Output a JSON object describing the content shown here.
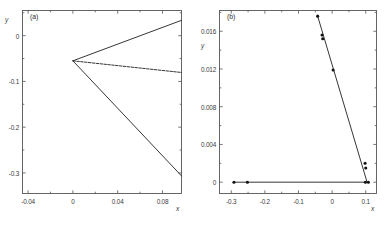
{
  "figure": {
    "background": "#ffffff",
    "line_color": "#2b2b2b",
    "marker_color": "#111111",
    "axis_color": "#555555"
  },
  "panels": [
    {
      "tag": "(a)",
      "xlabel": "x",
      "ylabel": "y",
      "xticks": [
        "-0.04",
        "0",
        "0.04",
        "0.08"
      ],
      "xtick_values": [
        -0.04,
        0,
        0.04,
        0.08
      ],
      "yticks": [
        "0",
        "-0.1",
        "-0.2",
        "-0.3"
      ],
      "ytick_values": [
        0,
        -0.1,
        -0.2,
        -0.3
      ],
      "xlim": [
        -0.045,
        0.097
      ],
      "ylim": [
        -0.345,
        0.055
      ]
    },
    {
      "tag": "(b)",
      "xlabel": "x",
      "ylabel": "y",
      "xticks": [
        "-0.3",
        "-0.2",
        "-0.1",
        "0",
        "0.1"
      ],
      "xtick_values": [
        -0.3,
        -0.2,
        -0.1,
        0,
        0.1
      ],
      "yticks": [
        "0",
        "0.004",
        "0.008",
        "0.012",
        "0.016"
      ],
      "ytick_values": [
        0,
        0.004,
        0.008,
        0.012,
        0.016
      ],
      "xlim": [
        -0.335,
        0.132
      ],
      "ylim": [
        -0.0012,
        0.0182
      ]
    }
  ],
  "chart_data": [
    {
      "type": "line",
      "title": "(a)",
      "xlabel": "x",
      "ylabel": "y",
      "xlim": [
        -0.045,
        0.097
      ],
      "ylim": [
        -0.345,
        0.055
      ],
      "xticks": [
        -0.04,
        0,
        0.04,
        0.08
      ],
      "yticks": [
        0,
        -0.1,
        -0.2,
        -0.3
      ],
      "grid": false,
      "legend": "none",
      "series": [
        {
          "name": "upper-branch",
          "style": "solid",
          "x": [
            0.0,
            0.097
          ],
          "y": [
            -0.055,
            0.0335
          ]
        },
        {
          "name": "middle-branch",
          "style": "dashed",
          "x": [
            0.0,
            0.097
          ],
          "y": [
            -0.055,
            -0.0805
          ]
        },
        {
          "name": "lower-branch",
          "style": "solid",
          "x": [
            0.0,
            0.097
          ],
          "y": [
            -0.055,
            -0.3065
          ]
        }
      ],
      "annotations": [
        {
          "text": "vertex",
          "x": 0.0,
          "y": -0.055
        }
      ]
    },
    {
      "type": "line",
      "title": "(b)",
      "xlabel": "x",
      "ylabel": "y",
      "xlim": [
        -0.335,
        0.132
      ],
      "ylim": [
        -0.0012,
        0.0182
      ],
      "xticks": [
        -0.3,
        -0.2,
        -0.1,
        0,
        0.1
      ],
      "yticks": [
        0,
        0.004,
        0.008,
        0.012,
        0.016
      ],
      "grid": false,
      "legend": "none",
      "series": [
        {
          "name": "steep-branch",
          "style": "solid",
          "x": [
            -0.043,
            0.104
          ],
          "y": [
            0.0176,
            0.0
          ]
        },
        {
          "name": "steep-branch-markers",
          "style": "markers",
          "x": [
            -0.043,
            -0.03,
            -0.028,
            0.003,
            0.098,
            0.1
          ],
          "y": [
            0.0176,
            0.0156,
            0.0152,
            0.0119,
            0.002,
            0.0015
          ]
        },
        {
          "name": "baseline-branch",
          "style": "solid",
          "x": [
            -0.292,
            0.108
          ],
          "y": [
            0.0,
            0.0
          ]
        },
        {
          "name": "baseline-markers",
          "style": "markers",
          "x": [
            -0.292,
            -0.252,
            0.099,
            0.108
          ],
          "y": [
            0.0,
            0.0,
            0.0,
            0.0
          ]
        }
      ]
    }
  ]
}
